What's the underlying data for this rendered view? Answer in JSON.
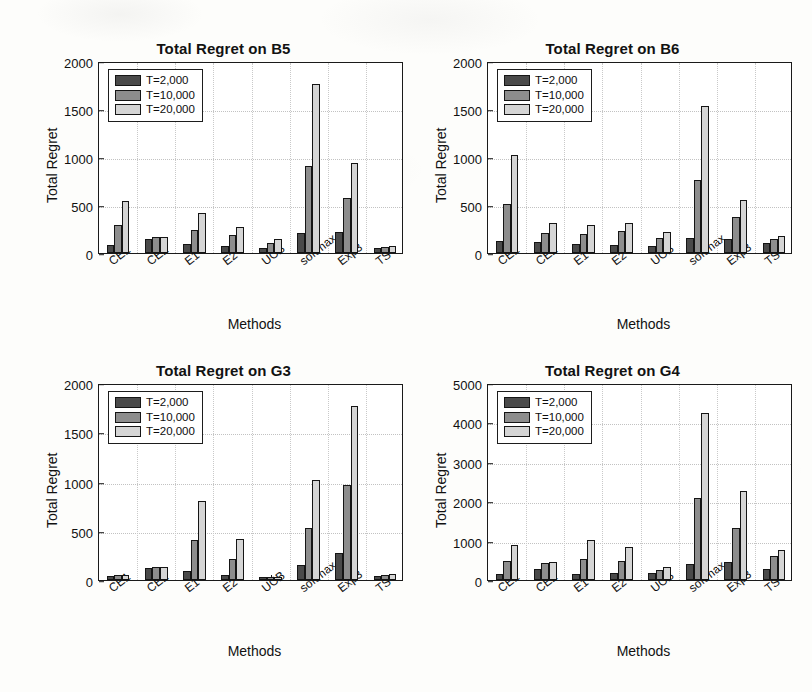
{
  "figure": {
    "series_labels": [
      "T=2,000",
      "T=10,000",
      "T=20,000"
    ],
    "series_colors": [
      "#4a4a4a",
      "#8d8d8d",
      "#d5d5d5"
    ],
    "shared_xlabel": "Methods",
    "shared_ylabel": "Total Regret",
    "categories": [
      "CE1",
      "CE2",
      "E1",
      "E2",
      "UCB",
      "softmax",
      "Exp3",
      "TS"
    ]
  },
  "chart_data": [
    {
      "type": "bar",
      "title": "Total Regret on B5",
      "xlabel": "Methods",
      "ylabel": "Total Regret",
      "categories": [
        "CE1",
        "CE2",
        "E1",
        "E2",
        "UCB",
        "softmax",
        "Exp3",
        "TS"
      ],
      "series": [
        {
          "name": "T=2,000",
          "values": [
            85,
            150,
            95,
            70,
            55,
            205,
            215,
            50
          ]
        },
        {
          "name": "T=10,000",
          "values": [
            290,
            165,
            240,
            185,
            105,
            905,
            570,
            60
          ]
        },
        {
          "name": "T=20,000",
          "values": [
            545,
            170,
            420,
            275,
            150,
            1760,
            935,
            70
          ]
        }
      ],
      "ylim": [
        0,
        2000
      ],
      "yticks": [
        0,
        500,
        1000,
        1500,
        2000
      ],
      "grid": true,
      "legend_position": "top-left"
    },
    {
      "type": "bar",
      "title": "Total Regret on B6",
      "xlabel": "Methods",
      "ylabel": "Total Regret",
      "categories": [
        "CE1",
        "CE2",
        "E1",
        "E2",
        "UCB",
        "softmax",
        "Exp3",
        "TS"
      ],
      "series": [
        {
          "name": "T=2,000",
          "values": [
            120,
            115,
            95,
            85,
            70,
            155,
            150,
            100
          ]
        },
        {
          "name": "T=10,000",
          "values": [
            515,
            210,
            200,
            225,
            155,
            765,
            375,
            150
          ]
        },
        {
          "name": "T=20,000",
          "values": [
            1020,
            310,
            295,
            310,
            215,
            1530,
            555,
            180
          ]
        }
      ],
      "ylim": [
        0,
        2000
      ],
      "yticks": [
        0,
        500,
        1000,
        1500,
        2000
      ],
      "grid": true,
      "legend_position": "top-left"
    },
    {
      "type": "bar",
      "title": "Total Regret on G3",
      "xlabel": "Methods",
      "ylabel": "Total Regret",
      "categories": [
        "CE1",
        "CE2",
        "E1",
        "E2",
        "UCB",
        "softmax",
        "Exp3",
        "TS"
      ],
      "series": [
        {
          "name": "T=2,000",
          "values": [
            45,
            125,
            90,
            55,
            30,
            150,
            275,
            40
          ]
        },
        {
          "name": "T=10,000",
          "values": [
            50,
            130,
            410,
            215,
            35,
            525,
            960,
            50
          ]
        },
        {
          "name": "T=20,000",
          "values": [
            50,
            135,
            805,
            415,
            35,
            1015,
            1765,
            60
          ]
        }
      ],
      "ylim": [
        0,
        2000
      ],
      "yticks": [
        0,
        500,
        1000,
        1500,
        2000
      ],
      "grid": true,
      "legend_position": "top-left"
    },
    {
      "type": "bar",
      "title": "Total Regret on G4",
      "xlabel": "Methods",
      "ylabel": "Total Regret",
      "categories": [
        "CE1",
        "CE2",
        "E1",
        "E2",
        "UCB",
        "softmax",
        "Exp3",
        "TS"
      ],
      "series": [
        {
          "name": "T=2,000",
          "values": [
            140,
            285,
            155,
            175,
            170,
            410,
            455,
            290
          ]
        },
        {
          "name": "T=10,000",
          "values": [
            480,
            425,
            545,
            490,
            265,
            2080,
            1310,
            600
          ]
        },
        {
          "name": "T=20,000",
          "values": [
            890,
            465,
            1010,
            840,
            340,
            4230,
            2250,
            760
          ]
        }
      ],
      "ylim": [
        0,
        5000
      ],
      "yticks": [
        0,
        1000,
        2000,
        3000,
        4000,
        5000
      ],
      "grid": true,
      "legend_position": "top-left"
    }
  ]
}
